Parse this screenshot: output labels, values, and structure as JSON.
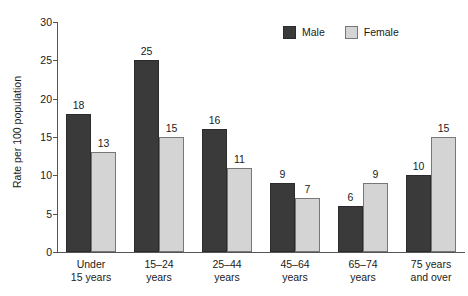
{
  "chart_data": {
    "type": "bar",
    "title": "",
    "subtitle": "",
    "xlabel": "",
    "ylabel": "Rate per 100 population",
    "ylim": [
      0,
      30
    ],
    "yticks": [
      0,
      5,
      10,
      15,
      20,
      25,
      30
    ],
    "ytick_labels": [
      "0",
      "5",
      "10",
      "15",
      "20",
      "25",
      "30"
    ],
    "grid": false,
    "legend_position": "top-right",
    "categories": [
      "Under 15 years",
      "15–24 years",
      "25–44 years",
      "45–64 years",
      "65–74 years",
      "75 years and over"
    ],
    "category_lines": [
      [
        "Under",
        "15 years"
      ],
      [
        "15–24",
        "years"
      ],
      [
        "25–44",
        "years"
      ],
      [
        "45–64",
        "years"
      ],
      [
        "65–74",
        "years"
      ],
      [
        "75 years",
        "and over"
      ]
    ],
    "series": [
      {
        "name": "Male",
        "color": "#3a3a3a",
        "values": [
          18,
          25,
          16,
          9,
          6,
          10
        ],
        "labels": [
          "18",
          "25",
          "16",
          "9",
          "6",
          "10"
        ]
      },
      {
        "name": "Female",
        "color": "#d4d4d4",
        "values": [
          13,
          15,
          11,
          7,
          9,
          15
        ],
        "labels": [
          "13",
          "15",
          "11",
          "7",
          "9",
          "15"
        ]
      }
    ]
  },
  "legend": {
    "items": [
      {
        "label": "Male",
        "color": "#3a3a3a"
      },
      {
        "label": "Female",
        "color": "#d4d4d4"
      }
    ]
  },
  "colors": {
    "male": "#3a3a3a",
    "female": "#d4d4d4",
    "axis": "#555555",
    "text": "#1a1a1a",
    "background": "#ffffff"
  }
}
